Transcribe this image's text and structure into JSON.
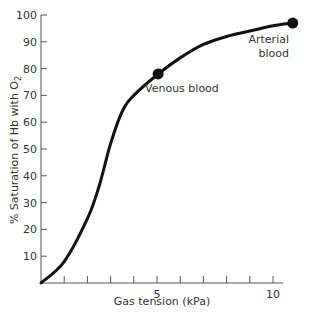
{
  "chart_data": {
    "type": "line",
    "title": "",
    "xlabel": "Gas tension (kPa)",
    "ylabel": "% Saturation of Hb with O2",
    "xlim": [
      0,
      11.3
    ],
    "ylim": [
      0,
      100
    ],
    "x_tick_labels": [
      "5",
      "10"
    ],
    "x_minor_ticks": [
      1,
      2,
      3,
      4,
      5,
      6,
      7,
      8,
      9,
      10
    ],
    "y_tick_labels": [
      "10",
      "20",
      "30",
      "40",
      "50",
      "60",
      "70",
      "80",
      "90",
      "100"
    ],
    "grid": false,
    "series": [
      {
        "name": "Oxyhaemoglobin dissociation curve",
        "x": [
          0,
          1,
          2,
          2.5,
          3,
          3.5,
          4,
          5.05,
          6,
          7,
          8,
          9,
          10,
          10.85
        ],
        "y": [
          0,
          8,
          24,
          36,
          52,
          64,
          70,
          78,
          84,
          89,
          92,
          94,
          96,
          97
        ]
      }
    ],
    "annotations": [
      {
        "label": "Venous blood",
        "x": 5.05,
        "y": 78
      },
      {
        "label": "Arterial blood",
        "x": 10.85,
        "y": 97
      }
    ]
  },
  "labels": {
    "xlabel": "Gas tension (kPa)",
    "ylabel_main": "% Saturation of Hb with O",
    "ylabel_sub": "2",
    "venous": "Venous blood",
    "arterial_1": "Arterial",
    "arterial_2": "blood"
  }
}
